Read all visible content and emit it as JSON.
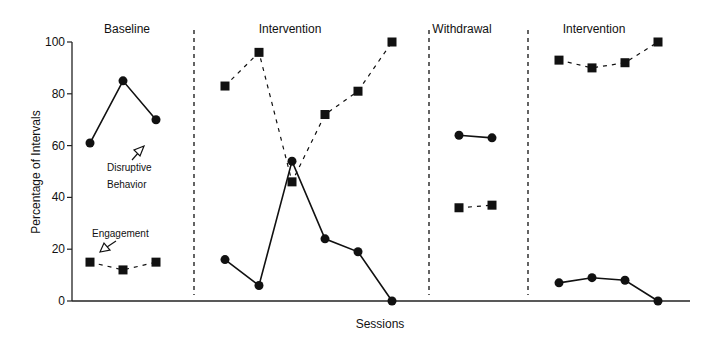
{
  "chart_data": {
    "type": "line",
    "title": "",
    "xlabel": "Sessions",
    "ylabel": "Percentage of Intervals",
    "ylim": [
      0,
      100
    ],
    "yticks": [
      0,
      20,
      40,
      60,
      80,
      100
    ],
    "grid": false,
    "phases": [
      {
        "label": "Baseline",
        "sessions": [
          1,
          2,
          3
        ]
      },
      {
        "label": "Intervention",
        "sessions": [
          4,
          5,
          6,
          7,
          8,
          9
        ]
      },
      {
        "label": "Withdrawal",
        "sessions": [
          10,
          11
        ]
      },
      {
        "label": "Intervention",
        "sessions": [
          12,
          13,
          14,
          15
        ]
      }
    ],
    "series": [
      {
        "name": "Disruptive Behavior",
        "marker": "circle",
        "line": "solid",
        "phases": [
          [
            61,
            85,
            70
          ],
          [
            16,
            6,
            54,
            24,
            19,
            0
          ],
          [
            64,
            63
          ],
          [
            7,
            9,
            8,
            0
          ]
        ]
      },
      {
        "name": "Engagement",
        "marker": "square",
        "line": "dashed",
        "phases": [
          [
            15,
            12,
            15
          ],
          [
            83,
            96,
            46,
            72,
            81,
            100
          ],
          [
            36,
            37
          ],
          [
            93,
            90,
            92,
            100
          ]
        ]
      }
    ],
    "annotations": [
      {
        "text": [
          "Disruptive",
          "Behavior"
        ],
        "target": "Disruptive Behavior"
      },
      {
        "text": [
          "Engagement"
        ],
        "target": "Engagement"
      }
    ]
  },
  "layout": {
    "x_axis_left": 72,
    "x_axis_right": 690,
    "y_top": 42,
    "y_bottom": 301,
    "phase_x": [
      [
        90,
        123,
        156
      ],
      [
        225,
        259,
        292,
        325,
        358,
        392
      ],
      [
        459,
        492
      ],
      [
        559,
        592,
        625,
        658
      ]
    ],
    "phase_dividers": [
      194,
      429,
      528
    ],
    "phase_label_x": [
      127,
      290,
      462,
      594
    ],
    "colors": {
      "ink": "#111111",
      "axis": "#222222"
    }
  }
}
